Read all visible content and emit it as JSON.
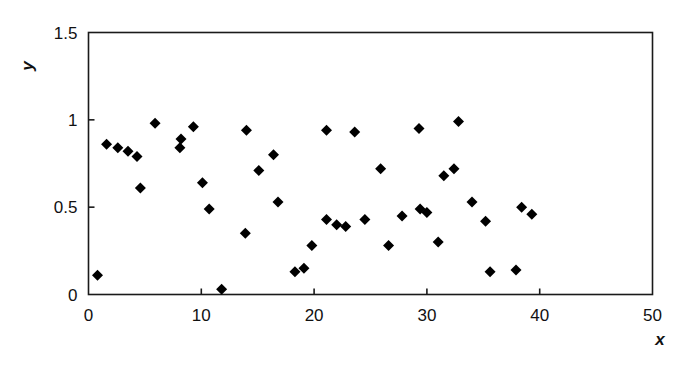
{
  "chart_data": {
    "type": "scatter",
    "title": "",
    "xlabel": "x",
    "ylabel": "y",
    "xlim": [
      0,
      50
    ],
    "ylim": [
      0,
      1.5
    ],
    "xticks": [
      0,
      10,
      20,
      30,
      40,
      50
    ],
    "yticks": [
      0,
      0.5,
      1,
      1.5
    ],
    "xtick_labels": [
      "0",
      "10",
      "20",
      "30",
      "40",
      "50"
    ],
    "ytick_labels": [
      "0",
      "0.5",
      "1",
      "1.5"
    ],
    "grid": false,
    "legend": null,
    "marker": "diamond",
    "marker_color": "#000000",
    "marker_size": 11,
    "frame": true,
    "points": [
      {
        "x": 0.8,
        "y": 0.11
      },
      {
        "x": 1.6,
        "y": 0.86
      },
      {
        "x": 2.6,
        "y": 0.84
      },
      {
        "x": 3.5,
        "y": 0.82
      },
      {
        "x": 4.3,
        "y": 0.79
      },
      {
        "x": 4.6,
        "y": 0.61
      },
      {
        "x": 5.9,
        "y": 0.98
      },
      {
        "x": 8.1,
        "y": 0.84
      },
      {
        "x": 8.2,
        "y": 0.89
      },
      {
        "x": 9.3,
        "y": 0.96
      },
      {
        "x": 10.1,
        "y": 0.64
      },
      {
        "x": 10.7,
        "y": 0.49
      },
      {
        "x": 11.8,
        "y": 0.03
      },
      {
        "x": 13.9,
        "y": 0.35
      },
      {
        "x": 14.0,
        "y": 0.94
      },
      {
        "x": 15.1,
        "y": 0.71
      },
      {
        "x": 16.4,
        "y": 0.8
      },
      {
        "x": 16.8,
        "y": 0.53
      },
      {
        "x": 18.3,
        "y": 0.13
      },
      {
        "x": 19.1,
        "y": 0.15
      },
      {
        "x": 19.8,
        "y": 0.28
      },
      {
        "x": 21.1,
        "y": 0.94
      },
      {
        "x": 21.1,
        "y": 0.43
      },
      {
        "x": 22.0,
        "y": 0.4
      },
      {
        "x": 22.8,
        "y": 0.39
      },
      {
        "x": 23.6,
        "y": 0.93
      },
      {
        "x": 24.5,
        "y": 0.43
      },
      {
        "x": 25.9,
        "y": 0.72
      },
      {
        "x": 26.6,
        "y": 0.28
      },
      {
        "x": 27.8,
        "y": 0.45
      },
      {
        "x": 29.3,
        "y": 0.95
      },
      {
        "x": 29.4,
        "y": 0.49
      },
      {
        "x": 30.0,
        "y": 0.47
      },
      {
        "x": 31.0,
        "y": 0.3
      },
      {
        "x": 31.5,
        "y": 0.68
      },
      {
        "x": 32.8,
        "y": 0.99
      },
      {
        "x": 32.4,
        "y": 0.72
      },
      {
        "x": 34.0,
        "y": 0.53
      },
      {
        "x": 35.2,
        "y": 0.42
      },
      {
        "x": 35.6,
        "y": 0.13
      },
      {
        "x": 37.9,
        "y": 0.14
      },
      {
        "x": 38.4,
        "y": 0.5
      },
      {
        "x": 39.3,
        "y": 0.46
      }
    ]
  }
}
